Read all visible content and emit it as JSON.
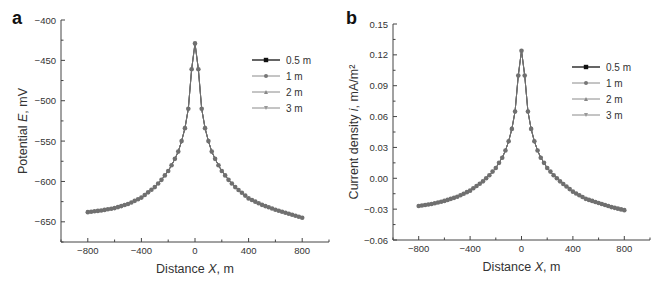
{
  "chart_data": [
    {
      "panel": "a",
      "type": "line",
      "title": "",
      "xlabel": "Distance X, m",
      "ylabel": "Potential E, mV",
      "xlim": [
        -1000,
        1000
      ],
      "ylim": [
        -675,
        -400
      ],
      "xticks": [
        -800,
        -400,
        0,
        400,
        800
      ],
      "xtick_labels": [
        "−800",
        "−400",
        "0",
        "400",
        "800"
      ],
      "yticks": [
        -400,
        -450,
        -500,
        -550,
        -600,
        -650
      ],
      "ytick_labels": [
        "−400",
        "−450",
        "−500",
        "−550",
        "−600",
        "−650"
      ],
      "grid": false,
      "legend_position": "upper right",
      "x": [
        -800,
        -700,
        -600,
        -500,
        -400,
        -300,
        -250,
        -200,
        -175,
        -150,
        -125,
        -100,
        -75,
        -50,
        -25,
        0,
        25,
        50,
        75,
        100,
        125,
        150,
        175,
        200,
        250,
        300,
        400,
        500,
        600,
        700,
        800
      ],
      "series": [
        {
          "name": "0.5 m",
          "marker": "square",
          "color": "#222222",
          "values": [
            -638,
            -636,
            -633,
            -628,
            -620,
            -607,
            -598,
            -587,
            -580,
            -572,
            -563,
            -550,
            -534,
            -510,
            -461,
            -429,
            -461,
            -510,
            -534,
            -550,
            -563,
            -572,
            -580,
            -587,
            -598,
            -607,
            -621,
            -629,
            -635,
            -640,
            -645
          ]
        },
        {
          "name": "1 m",
          "marker": "circle",
          "color": "#777777",
          "values": [
            -638,
            -636,
            -633,
            -628,
            -620,
            -607,
            -598,
            -587,
            -580,
            -572,
            -563,
            -550,
            -534,
            -510,
            -461,
            -429,
            -461,
            -510,
            -534,
            -550,
            -563,
            -572,
            -580,
            -587,
            -598,
            -607,
            -621,
            -629,
            -635,
            -640,
            -645
          ]
        },
        {
          "name": "2 m",
          "marker": "triangle-up",
          "color": "#888888",
          "values": [
            -638,
            -636,
            -633,
            -628,
            -620,
            -607,
            -598,
            -587,
            -580,
            -572,
            -563,
            -550,
            -534,
            -510,
            -461,
            -429,
            -461,
            -510,
            -534,
            -550,
            -563,
            -572,
            -580,
            -587,
            -598,
            -607,
            -621,
            -629,
            -635,
            -640,
            -645
          ]
        },
        {
          "name": "3 m",
          "marker": "triangle-down",
          "color": "#999999",
          "values": [
            -638,
            -636,
            -633,
            -628,
            -620,
            -607,
            -598,
            -587,
            -580,
            -572,
            -563,
            -550,
            -534,
            -510,
            -461,
            -429,
            -461,
            -510,
            -534,
            -550,
            -563,
            -572,
            -580,
            -587,
            -598,
            -607,
            -621,
            -629,
            -635,
            -640,
            -645
          ]
        }
      ]
    },
    {
      "panel": "b",
      "type": "line",
      "title": "",
      "xlabel": "Distance X, m",
      "ylabel": "Current density i, mA/m²",
      "xlim": [
        -1000,
        1000
      ],
      "ylim": [
        -0.06,
        0.15
      ],
      "xticks": [
        -800,
        -400,
        0,
        400,
        800
      ],
      "xtick_labels": [
        "−800",
        "−400",
        "0",
        "400",
        "800"
      ],
      "yticks": [
        0.15,
        0.12,
        0.09,
        0.06,
        0.03,
        0.0,
        -0.03,
        -0.06
      ],
      "ytick_labels": [
        "0.15",
        "0.12",
        "0.09",
        "0.06",
        "0.03",
        "0.00",
        "−0.03",
        "−0.06"
      ],
      "grid": false,
      "legend_position": "upper right",
      "x": [
        -800,
        -700,
        -600,
        -500,
        -400,
        -300,
        -250,
        -200,
        -175,
        -150,
        -125,
        -100,
        -75,
        -50,
        -25,
        0,
        25,
        50,
        75,
        100,
        125,
        150,
        175,
        200,
        250,
        300,
        400,
        500,
        600,
        700,
        800
      ],
      "series": [
        {
          "name": "0.5 m",
          "marker": "square",
          "color": "#222222",
          "values": [
            -0.027,
            -0.025,
            -0.022,
            -0.018,
            -0.012,
            -0.003,
            0.003,
            0.01,
            0.015,
            0.02,
            0.027,
            0.036,
            0.048,
            0.065,
            0.1,
            0.124,
            0.1,
            0.065,
            0.048,
            0.036,
            0.027,
            0.02,
            0.015,
            0.01,
            0.003,
            -0.003,
            -0.013,
            -0.02,
            -0.024,
            -0.028,
            -0.031
          ]
        },
        {
          "name": "1 m",
          "marker": "circle",
          "color": "#777777",
          "values": [
            -0.027,
            -0.025,
            -0.022,
            -0.018,
            -0.012,
            -0.003,
            0.003,
            0.01,
            0.015,
            0.02,
            0.027,
            0.036,
            0.048,
            0.065,
            0.1,
            0.124,
            0.1,
            0.065,
            0.048,
            0.036,
            0.027,
            0.02,
            0.015,
            0.01,
            0.003,
            -0.003,
            -0.013,
            -0.02,
            -0.024,
            -0.028,
            -0.031
          ]
        },
        {
          "name": "2 m",
          "marker": "triangle-up",
          "color": "#888888",
          "values": [
            -0.027,
            -0.025,
            -0.022,
            -0.018,
            -0.012,
            -0.003,
            0.003,
            0.01,
            0.015,
            0.02,
            0.027,
            0.036,
            0.048,
            0.065,
            0.1,
            0.124,
            0.1,
            0.065,
            0.048,
            0.036,
            0.027,
            0.02,
            0.015,
            0.01,
            0.003,
            -0.003,
            -0.013,
            -0.02,
            -0.024,
            -0.028,
            -0.031
          ]
        },
        {
          "name": "3 m",
          "marker": "triangle-down",
          "color": "#999999",
          "values": [
            -0.027,
            -0.025,
            -0.022,
            -0.018,
            -0.012,
            -0.003,
            0.003,
            0.01,
            0.015,
            0.02,
            0.027,
            0.036,
            0.048,
            0.065,
            0.1,
            0.124,
            0.1,
            0.065,
            0.048,
            0.036,
            0.027,
            0.02,
            0.015,
            0.01,
            0.003,
            -0.003,
            -0.013,
            -0.02,
            -0.024,
            -0.028,
            -0.031
          ]
        }
      ]
    }
  ],
  "panels": {
    "a": {
      "letter": "a",
      "xlabel_prefix": "Distance ",
      "xlabel_var": "X",
      "xlabel_suffix": ", m",
      "ylabel_prefix": "Potential ",
      "ylabel_var": "E",
      "ylabel_suffix": ", mV"
    },
    "b": {
      "letter": "b",
      "xlabel_prefix": "Distance ",
      "xlabel_var": "X",
      "xlabel_suffix": ", m",
      "ylabel_prefix": "Current density ",
      "ylabel_var": "i",
      "ylabel_suffix": ", mA/m²"
    }
  },
  "legend": [
    "0.5 m",
    "1 m",
    "2 m",
    "3 m"
  ]
}
